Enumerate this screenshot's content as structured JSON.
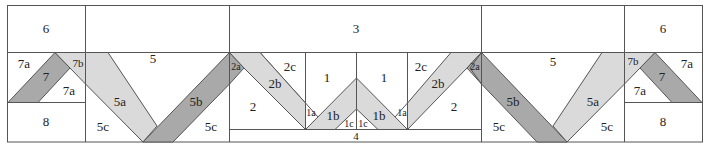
{
  "diagram": {
    "type": "quilt-block-piecing-diagram",
    "colors": {
      "dark": "#a9a9a9",
      "light": "#dadada",
      "background": "#ffffff",
      "line": "#555555"
    },
    "labels": {
      "l6": "6",
      "l7a_top": "7a",
      "l7b": "7b",
      "l7": "7",
      "l7a_bot": "7a",
      "l8": "8",
      "l5_left": "5",
      "l5a_left": "5a",
      "l5b_left": "5b",
      "l5c_left1": "5c",
      "l5c_left2": "5c",
      "l3": "3",
      "l2a_left": "2a",
      "l2b_left": "2b",
      "l2c_left": "2c",
      "l2_left": "2",
      "l1_left": "1",
      "l1_right": "1",
      "l1a_left": "1a",
      "l1b_left": "1b",
      "l1c_left": "1c",
      "l1c_right": "1c",
      "l1b_right": "1b",
      "l1a_right": "1a",
      "l2c_right": "2c",
      "l2b_right": "2b",
      "l2a_right": "2a",
      "l2_right": "2",
      "l4": "4",
      "l5_right": "5",
      "l5b_right": "5b",
      "l5a_right": "5a",
      "l5c_right1": "5c",
      "l5c_right2": "5c",
      "r6": "6",
      "r7b": "7b",
      "r7a_top": "7a",
      "r7": "7",
      "r7a_bot": "7a",
      "r8": "8"
    }
  }
}
